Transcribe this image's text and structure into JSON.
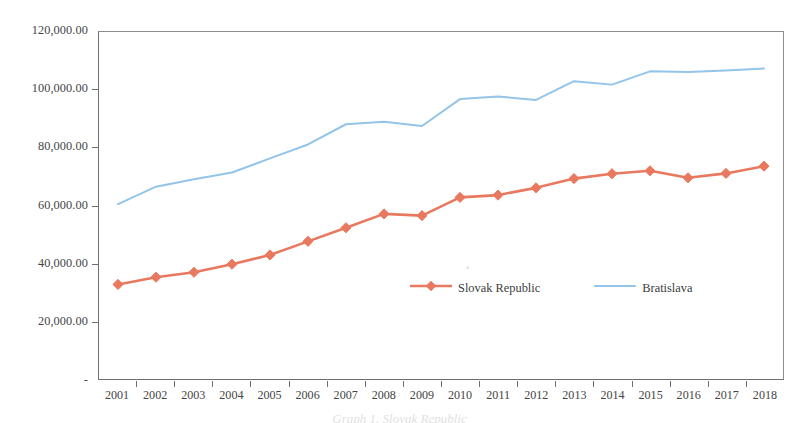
{
  "chart_data": {
    "type": "line",
    "title": "",
    "xlabel": "",
    "ylabel": "",
    "categories": [
      "2001",
      "2002",
      "2003",
      "2004",
      "2005",
      "2006",
      "2007",
      "2008",
      "2009",
      "2010",
      "2011",
      "2012",
      "2013",
      "2014",
      "2015",
      "2016",
      "2017",
      "2018"
    ],
    "ylim": [
      0,
      120000
    ],
    "ytick_values": [
      0,
      20000,
      40000,
      60000,
      80000,
      100000,
      120000
    ],
    "ytick_labels": [
      "-",
      "20,000.00",
      "40,000.00",
      "60,000.00",
      "80,000.00",
      "100,000.00",
      "120,000.00"
    ],
    "grid": false,
    "legend_position": "inside-bottom-center",
    "series": [
      {
        "name": "Slovak Republic",
        "color": "#E8795F",
        "marker": "diamond",
        "values": [
          32700,
          35200,
          36900,
          39700,
          42900,
          47600,
          52300,
          57100,
          56500,
          62800,
          63600,
          66100,
          69300,
          71000,
          72000,
          69600,
          71100,
          73600
        ]
      },
      {
        "name": "Bratislava",
        "color": "#93C4E9",
        "marker": "none",
        "values": [
          60500,
          66500,
          69100,
          71400,
          76300,
          81100,
          88100,
          89000,
          87500,
          96800,
          97700,
          96500,
          103000,
          101800,
          106400,
          106200,
          106700,
          107400
        ]
      }
    ],
    "annotations": []
  },
  "axes": {
    "y_tick_labels": [
      "120,000.00",
      "100,000.00",
      "80,000.00",
      "60,000.00",
      "40,000.00",
      "20,000.00",
      "-"
    ],
    "x_tick_labels": [
      "2001",
      "2002",
      "2003",
      "2004",
      "2005",
      "2006",
      "2007",
      "2008",
      "2009",
      "2010",
      "2011",
      "2012",
      "2013",
      "2014",
      "2015",
      "2016",
      "2017",
      "2018"
    ]
  },
  "legend": {
    "items": [
      {
        "label": "Slovak Republic",
        "color": "#E8795F",
        "marker": "diamond"
      },
      {
        "label": "Bratislava",
        "color": "#93C4E9",
        "marker": "none"
      }
    ]
  },
  "caption": {
    "text": "Graph 1. Slovak Republic"
  },
  "colors": {
    "slovak_republic": "#E8795F",
    "bratislava": "#93C4E9",
    "axis": "#6f6f6f",
    "text": "#454545",
    "background": "#ffffff"
  }
}
